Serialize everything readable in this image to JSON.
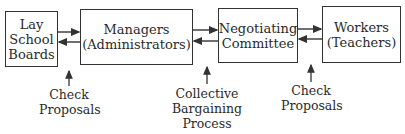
{
  "diagram": {
    "type": "flow",
    "nodes": [
      {
        "id": "lay-school-boards",
        "lines": [
          "Lay",
          "School",
          "Boards"
        ]
      },
      {
        "id": "managers",
        "lines": [
          "Managers",
          "(Administrators)"
        ]
      },
      {
        "id": "negotiating-committee",
        "lines": [
          "Negotiating",
          "Committee"
        ]
      },
      {
        "id": "workers",
        "lines": [
          "Workers",
          "(Teachers)"
        ]
      }
    ],
    "edges": [
      {
        "from": "lay-school-boards",
        "to": "managers",
        "bidirectional": true
      },
      {
        "from": "managers",
        "to": "negotiating-committee",
        "bidirectional": true
      },
      {
        "from": "negotiating-committee",
        "to": "workers",
        "bidirectional": true
      }
    ],
    "annotations": [
      {
        "id": "check-proposals-left",
        "lines": [
          "Check",
          "Proposals"
        ],
        "points_to": "link lay-school-boards/managers"
      },
      {
        "id": "collective-bargaining",
        "lines": [
          "Collective",
          "Bargaining",
          "Process"
        ],
        "points_to": "link managers/negotiating-committee"
      },
      {
        "id": "check-proposals-right",
        "lines": [
          "Check",
          "Proposals"
        ],
        "points_to": "link negotiating-committee/workers"
      }
    ]
  }
}
